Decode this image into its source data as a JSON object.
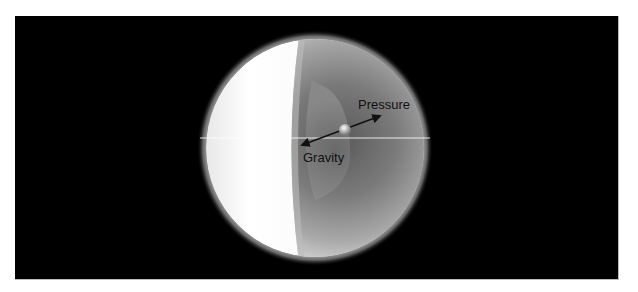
{
  "diagram": {
    "labels": {
      "pressure": "Pressure",
      "gravity": "Gravity"
    },
    "colors": {
      "background": "#000000",
      "sphere_light": "#ffffff",
      "sphere_dark": "#6e6e6e",
      "arrow": "#111111"
    }
  }
}
